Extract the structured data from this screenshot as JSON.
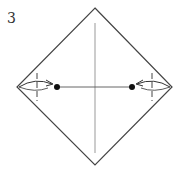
{
  "diagram": {
    "type": "origami-step",
    "step_number": "3",
    "shape": "square rotated 45° (diamond)",
    "vertices": {
      "top": [
        95,
        8
      ],
      "right": [
        172,
        87
      ],
      "bottom": [
        95,
        165
      ],
      "left": [
        17,
        87
      ]
    },
    "lines": {
      "vertical_crease": {
        "x": 95,
        "y1": 23,
        "y2": 153,
        "style": "thin solid gray"
      },
      "horizontal_crease": {
        "y": 87,
        "x1": 57,
        "x2": 132,
        "style": "thin solid"
      },
      "left_fold_line": {
        "x": 37,
        "style": "dashed (valley fold)"
      },
      "right_fold_line": {
        "x": 152,
        "style": "dashed (valley fold)"
      }
    },
    "reference_dots": [
      {
        "x": 57,
        "y": 87
      },
      {
        "x": 132,
        "y": 87
      }
    ],
    "arrows": [
      {
        "from": "left corner",
        "to": "left dot",
        "direction": "right"
      },
      {
        "from": "right corner",
        "to": "right dot",
        "direction": "left"
      }
    ],
    "colors": {
      "outline": "#444444",
      "crease": "#999999",
      "dot": "#111111"
    }
  }
}
